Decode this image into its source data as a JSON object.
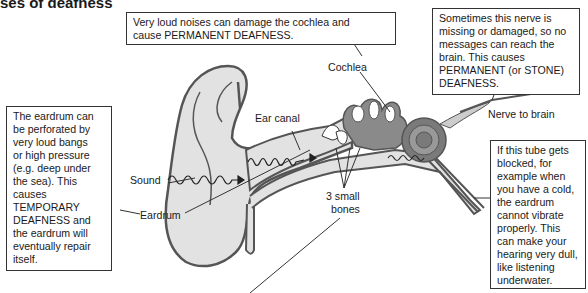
{
  "title": "ses of deafness",
  "boxes": {
    "cochlea_damage": [
      "Very loud noises can damage the cochlea and",
      "cause PERMANENT DEAFNESS."
    ],
    "nerve": [
      "Sometimes this nerve is",
      "missing or damaged, so no",
      "messages can reach the",
      "brain. This causes",
      "PERMANENT (or STONE)",
      "DEAFNESS."
    ],
    "eardrum": [
      "The eardrum can",
      "be perforated by",
      "very loud bangs",
      "or high pressure",
      "(e.g. deep under",
      "the sea). This",
      "causes",
      "TEMPORARY",
      "DEAFNESS and",
      "the eardrum will",
      "eventually repair",
      "itself."
    ],
    "tube": [
      "If this tube gets",
      "blocked, for",
      "example when",
      "you have a cold,",
      "the eardrum",
      "cannot vibrate",
      "properly. This",
      "can make your",
      "hearing very dull,",
      "like listening",
      "underwater."
    ]
  },
  "labels": {
    "cochlea": "Cochlea",
    "ear_canal": "Ear canal",
    "nerve_to_brain": "Nerve to brain",
    "sound": "Sound",
    "eardrum": "Eardrum",
    "small_bones_1": "3 small",
    "small_bones_2": "bones"
  },
  "colors": {
    "ear_fill": "#e2e2e2",
    "ear_outline": "#555555",
    "inner_ear": "#8a8a8a",
    "inner_dark": "#6a6a6a"
  }
}
